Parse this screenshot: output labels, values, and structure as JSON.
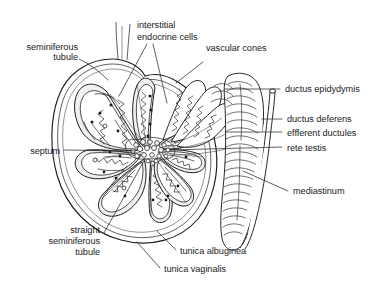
{
  "figure": {
    "background_color": "#ffffff",
    "ink_color": "#1a1a1a",
    "lobule_fill": "#f0f0f0",
    "width": 390,
    "height": 292
  },
  "labels": {
    "seminiferous_tubule": "seminiferous\ntubule",
    "seminiferous_tubule_line1": "seminiferous",
    "seminiferous_tubule_line2": "tubule",
    "interstitial_endocrine_cells_line1": "interstitial",
    "interstitial_endocrine_cells_line2": "endocrine cells",
    "vascular_cones": "vascular cones",
    "ductus_epidydymis": "ductus epidydymis",
    "ductus_deferens": "ductus deferens",
    "efferent_ductules": "effferent ductules",
    "rete_testis": "rete testis",
    "mediastinum": "mediastinum",
    "septum": "septum",
    "straight_seminiferous_tubule_line1": "straight",
    "straight_seminiferous_tubule_line2": "seminiferous",
    "straight_seminiferous_tubule_line3": "tubule",
    "tunica_albuginea": "tunica albuginea",
    "tunica_vaginalis": "tunica vaginalis"
  },
  "structures": [
    {
      "name": "seminiferous-tubule",
      "side": "left"
    },
    {
      "name": "interstitial-endocrine-cells",
      "side": "top"
    },
    {
      "name": "vascular-cones",
      "side": "top-right"
    },
    {
      "name": "ductus-epidydymis",
      "side": "right"
    },
    {
      "name": "ductus-deferens",
      "side": "right"
    },
    {
      "name": "efferent-ductules",
      "side": "right"
    },
    {
      "name": "rete-testis",
      "side": "right"
    },
    {
      "name": "mediastinum",
      "side": "right"
    },
    {
      "name": "septum",
      "side": "left"
    },
    {
      "name": "straight-seminiferous-tubule",
      "side": "bottom-left"
    },
    {
      "name": "tunica-albuginea",
      "side": "bottom"
    },
    {
      "name": "tunica-vaginalis",
      "side": "bottom"
    }
  ]
}
